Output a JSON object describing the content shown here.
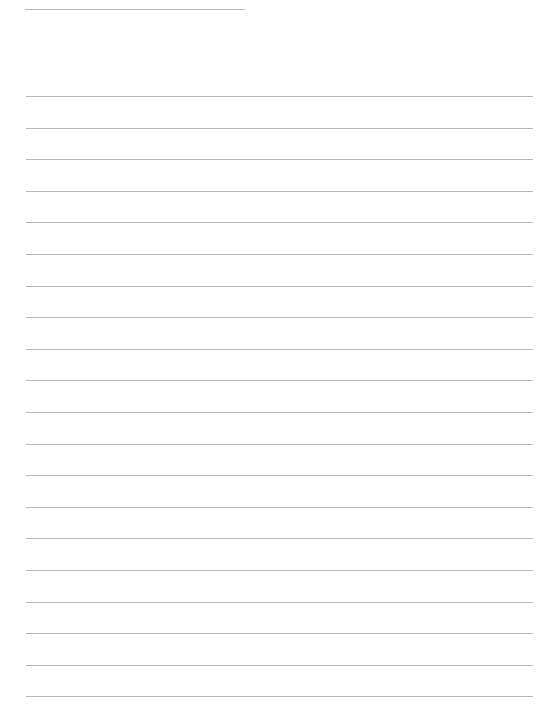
{
  "page": {
    "type": "blank-lined-writing-sheet",
    "background_color": "#ffffff",
    "line_color": "#b8b8b8",
    "header_line": {
      "x": 25,
      "y": 9,
      "width": 220
    },
    "ruled_lines": {
      "count": 20,
      "first_y": 96,
      "spacing": 31.6,
      "x_start": 26,
      "x_end": 533
    },
    "text_content": []
  }
}
